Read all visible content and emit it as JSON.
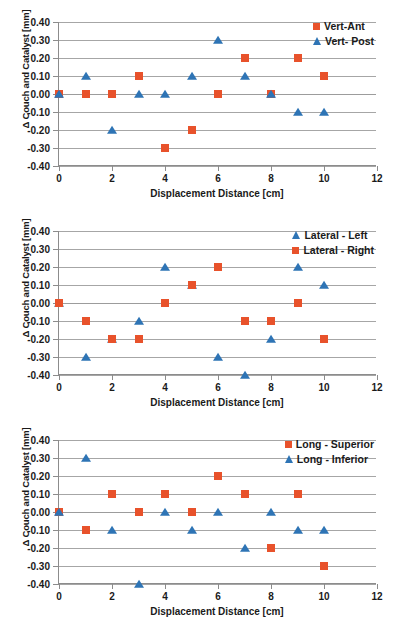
{
  "colors": {
    "red": "#E8522B",
    "blue": "#2E74B5",
    "grid": "#A6A6A6",
    "axis": "#8C8C8C",
    "text": "#1A1A1A"
  },
  "common": {
    "xlabel": "Displacement Distance [cm]",
    "ylabel": "Δ Couch and Catalyst [mm]",
    "xticks": [
      "0",
      "2",
      "4",
      "6",
      "8",
      "10",
      "12"
    ],
    "xtick_values": [
      0,
      2,
      4,
      6,
      8,
      10,
      12
    ],
    "yticks": [
      "0.40",
      "0.30",
      "0.20",
      "0.10",
      "0.00",
      "-0.10",
      "-0.20",
      "-0.30",
      "-0.40"
    ],
    "ytick_values": [
      0.4,
      0.3,
      0.2,
      0.1,
      0.0,
      -0.1,
      -0.2,
      -0.3,
      -0.4
    ],
    "xlim": [
      0,
      12
    ],
    "ylim": [
      -0.4,
      0.4
    ],
    "square_marker": "square-marker",
    "triangle_marker": "triangle-marker"
  },
  "chart_data": [
    {
      "type": "scatter",
      "title": "",
      "xlabel": "Displacement Distance [cm]",
      "ylabel": "Δ Couch and Catalyst [mm]",
      "xlim": [
        0,
        12
      ],
      "ylim": [
        -0.4,
        0.4
      ],
      "grid": true,
      "legend_position": "top-right",
      "x": [
        0,
        1,
        2,
        3,
        4,
        5,
        6,
        7,
        8,
        9,
        10
      ],
      "series": [
        {
          "name": "Vert-Ant",
          "marker": "square",
          "color": "#E8522B",
          "values": [
            0.0,
            0.0,
            0.0,
            0.1,
            -0.3,
            -0.2,
            0.0,
            0.2,
            0.0,
            0.2,
            0.1
          ]
        },
        {
          "name": "Vert- Post",
          "marker": "triangle",
          "color": "#2E74B5",
          "values": [
            0.0,
            0.1,
            -0.2,
            0.0,
            0.0,
            0.1,
            0.3,
            0.1,
            0.0,
            -0.1,
            -0.1
          ]
        }
      ]
    },
    {
      "type": "scatter",
      "title": "",
      "xlabel": "Displacement Distance [cm]",
      "ylabel": "Δ Couch and Catalyst [mm]",
      "xlim": [
        0,
        12
      ],
      "ylim": [
        -0.4,
        0.4
      ],
      "grid": true,
      "legend_position": "top-right",
      "x": [
        0,
        1,
        2,
        3,
        4,
        5,
        6,
        7,
        8,
        9,
        10
      ],
      "series": [
        {
          "name": "Lateral - Left",
          "marker": "triangle",
          "color": "#2E74B5",
          "values": [
            0.0,
            -0.3,
            -0.2,
            -0.1,
            0.2,
            0.1,
            -0.3,
            -0.4,
            -0.2,
            0.2,
            0.1
          ]
        },
        {
          "name": "Lateral - Right",
          "marker": "square",
          "color": "#E8522B",
          "values": [
            0.0,
            -0.1,
            -0.2,
            -0.2,
            0.0,
            0.1,
            0.2,
            -0.1,
            -0.1,
            0.0,
            -0.2
          ]
        }
      ]
    },
    {
      "type": "scatter",
      "title": "",
      "xlabel": "Displacement Distance [cm]",
      "ylabel": "Δ Couch and Catalyst [mm]",
      "xlim": [
        0,
        12
      ],
      "ylim": [
        -0.4,
        0.4
      ],
      "grid": true,
      "legend_position": "top-right",
      "x": [
        0,
        1,
        2,
        3,
        4,
        5,
        6,
        7,
        8,
        9,
        10
      ],
      "series": [
        {
          "name": "Long - Superior",
          "marker": "square",
          "color": "#E8522B",
          "values": [
            0.0,
            -0.1,
            0.1,
            0.0,
            0.1,
            0.0,
            0.2,
            0.1,
            -0.2,
            0.1,
            -0.3
          ]
        },
        {
          "name": "Long - Inferior",
          "marker": "triangle",
          "color": "#2E74B5",
          "values": [
            0.0,
            0.3,
            -0.1,
            -0.4,
            0.0,
            -0.1,
            0.0,
            -0.2,
            0.0,
            -0.1,
            -0.1
          ]
        }
      ]
    }
  ]
}
